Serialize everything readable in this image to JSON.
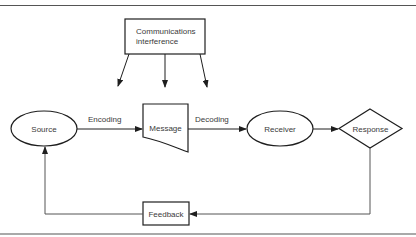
{
  "diagram": {
    "type": "communication-process-flow",
    "colors": {
      "stroke": "#1e1e1e",
      "text": "#3a3a3a",
      "rule": "#555555",
      "background": "#ffffff"
    },
    "nodes": {
      "interference": {
        "label_line1": "Communications",
        "label_line2": "interference",
        "shape": "rectangle"
      },
      "source": {
        "label": "Source",
        "shape": "ellipse"
      },
      "message": {
        "label": "Message",
        "shape": "document"
      },
      "receiver": {
        "label": "Receiver",
        "shape": "ellipse"
      },
      "response": {
        "label": "Response",
        "shape": "diamond"
      },
      "feedback": {
        "label": "Feedback",
        "shape": "rectangle"
      }
    },
    "edges": {
      "encoding": {
        "from": "Source",
        "to": "Message",
        "label": "Encoding"
      },
      "decoding": {
        "from": "Message",
        "to": "Receiver",
        "label": "Decoding"
      },
      "to_response": {
        "from": "Receiver",
        "to": "Response",
        "label": ""
      },
      "response_to_feedback": {
        "from": "Response",
        "to": "Feedback",
        "label": ""
      },
      "feedback_to_source": {
        "from": "Feedback",
        "to": "Source",
        "label": ""
      },
      "interference_arrows": {
        "from": "Communications interference",
        "count": 3
      }
    }
  }
}
